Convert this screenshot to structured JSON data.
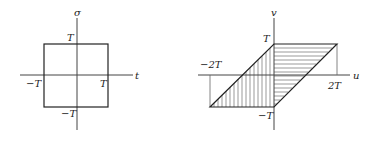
{
  "left_diagram": {
    "vertical_axis_label": "σ",
    "horizontal_axis_label": "t",
    "labels": {
      "top": "T",
      "right": "T",
      "left": "−T",
      "bottom": "−T"
    },
    "shape": "square",
    "region": "|σ| ≤ T, |t| ≤ T"
  },
  "right_diagram": {
    "vertical_axis_label": "v",
    "horizontal_axis_label": "u",
    "labels": {
      "top": "T",
      "bottom": "−T",
      "left": "−2T",
      "right": "2T"
    },
    "shape": "parallelogram",
    "vertices": [
      "(0, T)",
      "(2T, T)",
      "(0, −T)",
      "(−2T, −T)"
    ],
    "hatching": {
      "left_part": "vertical",
      "right_part": "horizontal"
    }
  },
  "colors": {
    "line": "#222222",
    "background": "#ffffff"
  }
}
